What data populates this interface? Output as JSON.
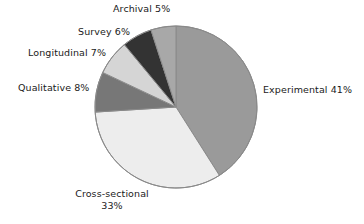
{
  "chart_data": {
    "type": "pie",
    "title": "",
    "subtitle": "",
    "xlabel": "",
    "ylabel": "",
    "legend_position": "none",
    "grid": false,
    "start_angle_deg": 0,
    "direction": "clockwise",
    "units": "percent",
    "categories": [
      "Experimental",
      "Cross-sectional",
      "Qualitative",
      "Longitudinal",
      "Survey",
      "Archival"
    ],
    "values": [
      41,
      33,
      8,
      7,
      6,
      5
    ],
    "colors": [
      "#9a9a9a",
      "#ededed",
      "#777777",
      "#d5d5d5",
      "#333333",
      "#a8a8a8"
    ],
    "slices": [
      {
        "name": "Experimental",
        "value": 41,
        "label": "Experimental 41%",
        "percent_text": "41%",
        "color": "#9a9a9a",
        "start_deg": 0,
        "end_deg": 147.6
      },
      {
        "name": "Cross-sectional",
        "value": 33,
        "label": "Cross-sectional 33%",
        "label_line1": "Cross-sectional",
        "label_line2": "33%",
        "percent_text": "33%",
        "color": "#ededed",
        "start_deg": 147.6,
        "end_deg": 266.4
      },
      {
        "name": "Qualitative",
        "value": 8,
        "label": "Qualitative 8%",
        "percent_text": "8%",
        "color": "#777777",
        "start_deg": 266.4,
        "end_deg": 295.2
      },
      {
        "name": "Longitudinal",
        "value": 7,
        "label": "Longitudinal 7%",
        "percent_text": "7%",
        "color": "#d5d5d5",
        "start_deg": 295.2,
        "end_deg": 320.4
      },
      {
        "name": "Survey",
        "value": 6,
        "label": "Survey 6%",
        "percent_text": "6%",
        "color": "#333333",
        "start_deg": 320.4,
        "end_deg": 342.0
      },
      {
        "name": "Archival",
        "value": 5,
        "label": "Archival 5%",
        "percent_text": "5%",
        "color": "#a8a8a8",
        "start_deg": 342.0,
        "end_deg": 360.0
      }
    ],
    "geometry": {
      "center_x": 176,
      "center_y": 107,
      "radius": 81
    },
    "style": {
      "background": "#ffffff",
      "stroke": "#8a8a8a",
      "text_color": "#1a1a1a"
    }
  }
}
